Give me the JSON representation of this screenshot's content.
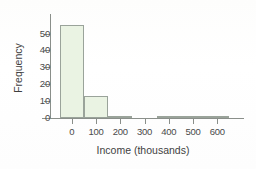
{
  "figure": {
    "kind": "scanned-histogram",
    "background_color": "#fefefe",
    "axis_color": "#8a8f8a",
    "bar_fill": "#eaf3e3",
    "bar_edge": "#9aa39a",
    "text_color": "#3f3f3f"
  },
  "chart_data": {
    "type": "bar",
    "title": "",
    "xlabel": "Income (thousands)",
    "ylabel": "Frequency",
    "xlim": [
      -90,
      710
    ],
    "ylim": [
      0,
      58
    ],
    "grid": false,
    "legend": null,
    "bin_width": 100,
    "categories": [
      "0",
      "100",
      "200",
      "300",
      "400",
      "500",
      "600"
    ],
    "xticks": [
      0,
      100,
      200,
      300,
      400,
      500,
      600
    ],
    "xtick_labels": [
      "0",
      "100",
      "200",
      "300",
      "400",
      "500",
      "600"
    ],
    "yticks": [
      0,
      10,
      20,
      30,
      40,
      50
    ],
    "ytick_labels": [
      "0",
      "10",
      "20",
      "30",
      "40",
      "50"
    ],
    "bins": [
      {
        "left": -50,
        "right": 50,
        "value": 55
      },
      {
        "left": 50,
        "right": 150,
        "value": 13
      },
      {
        "left": 150,
        "right": 250,
        "value": 1
      },
      {
        "left": 250,
        "right": 350,
        "value": 0
      },
      {
        "left": 350,
        "right": 450,
        "value": 1
      },
      {
        "left": 450,
        "right": 550,
        "value": 1
      },
      {
        "left": 550,
        "right": 650,
        "value": 1
      }
    ],
    "values": [
      55,
      13,
      1,
      0,
      1,
      1,
      1
    ]
  }
}
